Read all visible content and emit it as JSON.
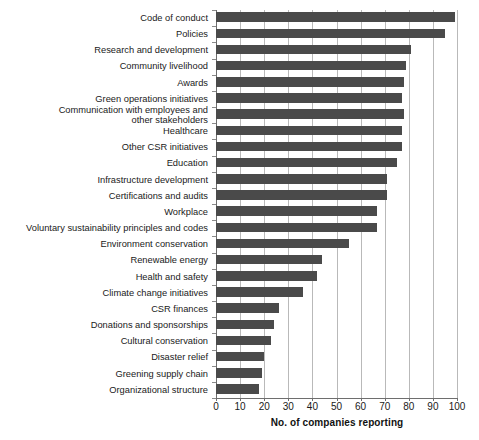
{
  "chart_data": {
    "type": "bar",
    "orientation": "horizontal",
    "title": "",
    "xlabel": "No. of companies reporting",
    "ylabel": "",
    "xlim": [
      0,
      100
    ],
    "xticks": [
      0,
      10,
      20,
      30,
      40,
      50,
      60,
      70,
      80,
      90,
      100
    ],
    "grid": "vertical",
    "legend": "none",
    "bar_color": "#4a4a4a",
    "categories": [
      "Code of conduct",
      "Policies",
      "Research and development",
      "Community livelihood",
      "Awards",
      "Green operations initiatives",
      "Communication with employees and\nother stakeholders",
      "Healthcare",
      "Other CSR initiatives",
      "Education",
      "Infrastructure development",
      "Certifications and audits",
      "Workplace",
      "Voluntary sustainability principles and codes",
      "Environment conservation",
      "Renewable energy",
      "Health and safety",
      "Climate change initiatives",
      "CSR finances",
      "Donations and sponsorships",
      "Cultural conservation",
      "Disaster relief",
      "Greening supply chain",
      "Organizational structure"
    ],
    "values": [
      99,
      95,
      81,
      79,
      78,
      77,
      78,
      77,
      77,
      75,
      71,
      71,
      67,
      67,
      55,
      44,
      42,
      36,
      26,
      24,
      23,
      20,
      19,
      18
    ]
  }
}
